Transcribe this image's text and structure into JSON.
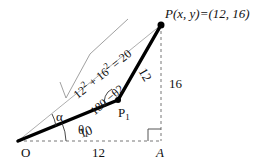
{
  "diagram": {
    "points": {
      "origin": {
        "label": "O"
      },
      "joint": {
        "label": "P",
        "subscript": "1"
      },
      "end_effector": {
        "label": "P(x, y)=(12, 16)"
      },
      "foot": {
        "label": "A"
      }
    },
    "lengths": {
      "link1": "10",
      "link2": "12",
      "base": "12",
      "height": "16",
      "hypotenuse_expr": "√(12² + 16²) = 20",
      "hyp_part1": "12",
      "hyp_sup1": "2",
      "hyp_part2": "+ 16",
      "hyp_sup2": "2",
      "hyp_part3": "= 20"
    },
    "angles": {
      "theta1": {
        "symbol": "θ",
        "subscript": "1"
      },
      "alpha": "α",
      "elbow": "180 −θ2"
    },
    "colors": {
      "link": "#000000",
      "dashed": "#777777",
      "hypotenuse": "#999999"
    }
  }
}
